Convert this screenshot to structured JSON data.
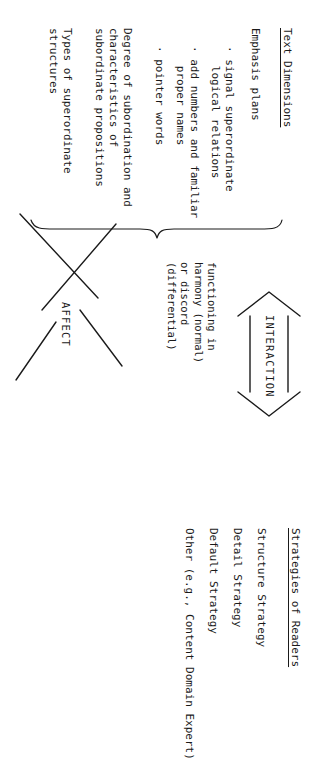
{
  "diagram": {
    "orientation": "page rotated 90 degrees; text reads bottom-to-top",
    "ink_color": "#1a1a1a",
    "background_color": "#ffffff"
  },
  "text_dimensions": {
    "heading": "Text Dimensions",
    "groups": [
      {
        "label": "Emphasis plans",
        "bullets": [
          "· signal superordinate\n   logical relations",
          "· add numbers and familiar\n   proper names",
          "· pointer words"
        ]
      },
      {
        "label": "Degree of subordination and\ncharacteristics of\nsubordinate propositions",
        "bullets": []
      },
      {
        "label": "Types of superordinate\nstructures",
        "bullets": []
      }
    ]
  },
  "interaction": {
    "arrow_label": "INTERACTION",
    "arrow_type": "double-headed-arrow",
    "caption": "functioning in\nharmony (normal)\nor discord\n(differential)"
  },
  "strategies_of_readers": {
    "heading": "Strategies of Readers",
    "items": [
      "Structure Strategy",
      "Detail Strategy",
      "Default Strategy",
      "Other (e.g., Content Domain Expert)"
    ]
  },
  "affect": {
    "arrow_label": "AFFECT",
    "arrow_type": "large-open-arrow"
  },
  "brace": {
    "name": "grouping-brace",
    "groups_spanned": 3
  }
}
